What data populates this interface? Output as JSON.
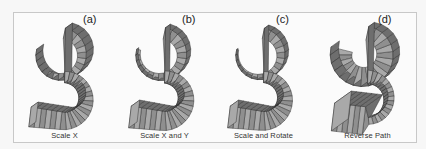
{
  "figure": {
    "panels": [
      {
        "tag": "(a)",
        "caption": "Scale X",
        "variant": "scale-x",
        "x": 0,
        "tag_x": 69
      },
      {
        "tag": "(b)",
        "caption": "Scale X and Y",
        "variant": "scale-xy",
        "x": 100,
        "tag_x": 68
      },
      {
        "tag": "(c)",
        "caption": "Scale and Rotate",
        "variant": "scale-rotate",
        "x": 199,
        "tag_x": 63
      },
      {
        "tag": "(d)",
        "caption": "Reverse Path",
        "variant": "reverse-path",
        "x": 303,
        "tag_x": 61
      }
    ]
  },
  "colors": {
    "face_light": "#a9a9a9",
    "face_mid": "#8f8f8f",
    "face_dark": "#6e6e6e",
    "edge": "#2a2a2a",
    "frame": "#c8c8c8",
    "background": "#fbfbfb"
  }
}
